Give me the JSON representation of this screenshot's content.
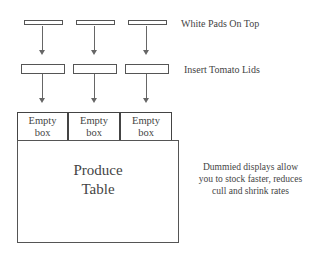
{
  "labels": {
    "white_pads": "White Pads On Top",
    "tomato_lids": "Insert Tomato Lids"
  },
  "boxes": [
    {
      "line1": "Empty",
      "line2": "box"
    },
    {
      "line1": "Empty",
      "line2": "box"
    },
    {
      "line1": "Empty",
      "line2": "box"
    }
  ],
  "table": {
    "line1": "Produce",
    "line2": "Table"
  },
  "note": {
    "line1": "Dummied displays allow",
    "line2": "you to stock faster, reduces",
    "line3": "cull and shrink rates"
  },
  "colors": {
    "stroke": "#555555",
    "background": "#ffffff"
  }
}
